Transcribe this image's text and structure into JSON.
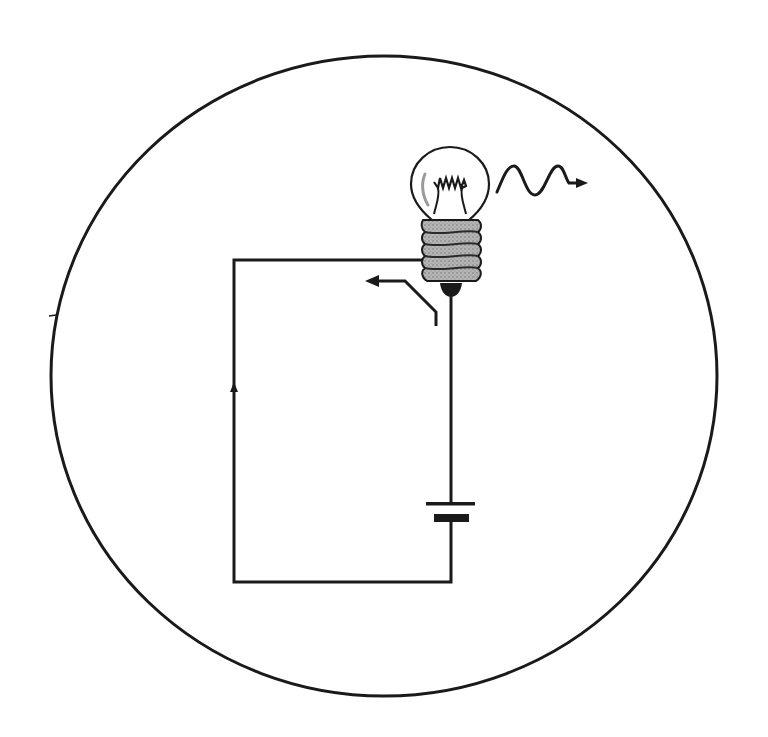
{
  "diagram": {
    "colors": {
      "background": "#ffffff",
      "stroke": "#1a1a1a",
      "bulb_base_fill": "#a8a8a8",
      "bulb_base_thread": "#2a2a2a",
      "glass_highlight": "#9a9a9a"
    },
    "components": [
      {
        "id": "boundary",
        "label": "boundary circle"
      },
      {
        "id": "bulb",
        "label": "light bulb"
      },
      {
        "id": "light-wave",
        "label": "emitted light wave"
      },
      {
        "id": "switch",
        "label": "open switch"
      },
      {
        "id": "battery",
        "label": "battery cell"
      },
      {
        "id": "current-arrow",
        "label": "current direction arrow"
      },
      {
        "id": "wires",
        "label": "circuit wires"
      }
    ]
  }
}
